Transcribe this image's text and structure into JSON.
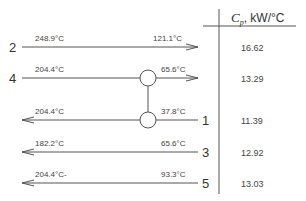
{
  "table_header": {
    "symbol": "C",
    "subscript": "p",
    "unit": ", kW/°C"
  },
  "streams": [
    {
      "id": "2",
      "direction": "right",
      "t_in": "248.9°C",
      "t_out": "121.1°C",
      "cp": "16.62",
      "y": 47
    },
    {
      "id": "4",
      "direction": "right",
      "t_in": "204.4°C",
      "t_out": "65.6°C",
      "cp": "13.29",
      "y": 78
    },
    {
      "id": "1",
      "direction": "left",
      "t_in": "37.8°C",
      "t_out": "204.4°C",
      "cp": "11.39",
      "y": 120
    },
    {
      "id": "3",
      "direction": "left",
      "t_in": "65.6°C",
      "t_out": "182.2°C",
      "cp": "12.92",
      "y": 152
    },
    {
      "id": "5",
      "direction": "left",
      "t_in": "93.3°C",
      "t_out": "204.4°C-",
      "cp": "13.03",
      "y": 183
    }
  ],
  "exchanger": {
    "connects": [
      "4",
      "1"
    ]
  },
  "colors": {
    "line": "#555555",
    "text": "#333333"
  }
}
